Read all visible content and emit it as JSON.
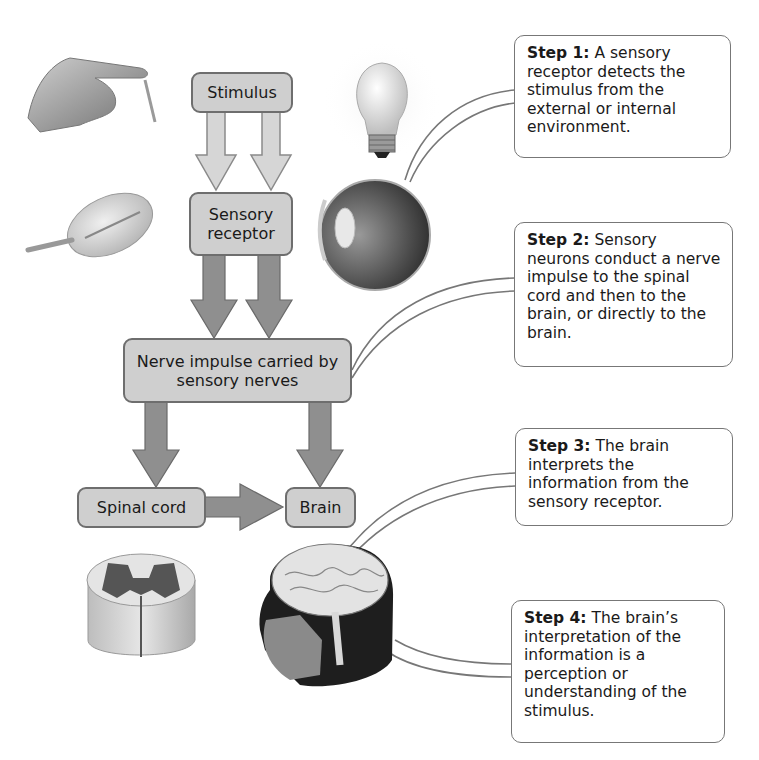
{
  "flow": {
    "stimulus": "Stimulus",
    "sensory_receptor": "Sensory receptor",
    "nerve_impulse": "Nerve impulse carried by sensory nerves",
    "spinal_cord": "Spinal cord",
    "brain": "Brain"
  },
  "steps": [
    {
      "label": "Step 1:",
      "text": " A sensory receptor detects the stimulus from the external or internal environment."
    },
    {
      "label": "Step 2:",
      "text": " Sensory neurons conduct a nerve impulse to the spinal cord and then to the brain, or directly to the brain."
    },
    {
      "label": "Step 3:",
      "text": " The brain interprets the information from the sensory receptor."
    },
    {
      "label": "Step 4:",
      "text": " The brain’s interpretation of the information is a perception or understanding of the stimulus."
    }
  ],
  "illustrations": [
    "hand-touching-icon",
    "pressure-receptor-icon",
    "light-bulb-icon",
    "eye-icon",
    "spinal-cord-section-icon",
    "head-with-brain-icon"
  ],
  "colors": {
    "box_fill": "#cfcfcf",
    "box_border": "#6e6e6e",
    "light_arrow": "#d6d6d6",
    "dark_arrow": "#8f8f8f",
    "callout_border": "#777777"
  }
}
